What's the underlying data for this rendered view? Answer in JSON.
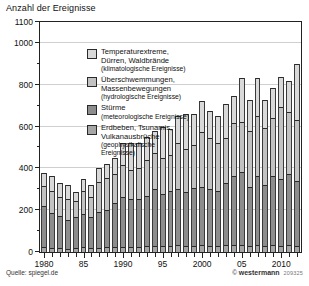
{
  "title": "Anzahl der Ereignisse",
  "source_label": "Quelle: spiegel.de",
  "credit": {
    "symbol": "©",
    "brand": "westermann",
    "code": "209325"
  },
  "colors": {
    "climatological": "#d9d9d9",
    "hydrological": "#c2c2c2",
    "meteorological": "#8d8d8d",
    "geophysical": "#a6a6a6",
    "grid": "#cfcfcf",
    "axis": "#222222",
    "background": "#ffffff"
  },
  "legend": {
    "position": "inside-top-left",
    "items": [
      {
        "key": "climatological",
        "main": "Temperaturextreme,",
        "main2": "Dürren, Waldbrände",
        "sub": "(klimatologische Ereignisse)",
        "color": "#d9d9d9"
      },
      {
        "key": "hydrological",
        "main": "Überschwemmungen,",
        "main2": "Massenbewegungen",
        "sub": "(hydrologische Ereignisse)",
        "color": "#c2c2c2"
      },
      {
        "key": "meteorological",
        "main": "Stürme",
        "main2": "",
        "sub": "(meteorologische Ereignisse)",
        "color": "#8d8d8d"
      },
      {
        "key": "geophysical",
        "main": "Erdbeben, Tsunamis,",
        "main2": "Vulkanausbrüche",
        "sub": "(geophysikalische",
        "sub2": "Ereignisse)",
        "color": "#a6a6a6"
      }
    ]
  },
  "chart_data": {
    "type": "bar",
    "stacked": true,
    "title": "Anzahl der Ereignisse",
    "xlabel": "",
    "ylabel": "Anzahl der Ereignisse",
    "ylim": [
      0,
      1100
    ],
    "ytick_step": 200,
    "yminor_step": 100,
    "ytick_labels": [
      "0",
      "200",
      "400",
      "600",
      "800",
      "1000",
      "1100"
    ],
    "ytick_values": [
      0,
      200,
      400,
      600,
      800,
      1000,
      1100
    ],
    "grid": true,
    "grid_axis": "y",
    "legend_position": "inside-top-left",
    "x": [
      1980,
      1981,
      1982,
      1983,
      1984,
      1985,
      1986,
      1987,
      1988,
      1989,
      1990,
      1991,
      1992,
      1993,
      1994,
      1995,
      1996,
      1997,
      1998,
      1999,
      2000,
      2001,
      2002,
      2003,
      2004,
      2005,
      2006,
      2007,
      2008,
      2009,
      2010,
      2011,
      2012
    ],
    "xtick_labels": [
      "1980",
      "85",
      "1990",
      "95",
      "2000",
      "05",
      "2010"
    ],
    "xtick_positions": [
      1980,
      1985,
      1990,
      1995,
      2000,
      2005,
      2010
    ],
    "categories": [
      1980,
      1981,
      1982,
      1983,
      1984,
      1985,
      1986,
      1987,
      1988,
      1989,
      1990,
      1991,
      1992,
      1993,
      1994,
      1995,
      1996,
      1997,
      1998,
      1999,
      2000,
      2001,
      2002,
      2003,
      2004,
      2005,
      2006,
      2007,
      2008,
      2009,
      2010,
      2011,
      2012
    ],
    "series": [
      {
        "name": "Erdbeben, Tsunamis, Vulkanausbrüche (geophysikalische Ereignisse)",
        "short": "geophysical",
        "color": "#a6a6a6",
        "values": [
          22,
          18,
          20,
          15,
          18,
          22,
          18,
          20,
          22,
          25,
          25,
          24,
          22,
          28,
          30,
          28,
          30,
          32,
          28,
          30,
          32,
          30,
          28,
          32,
          35,
          35,
          30,
          32,
          30,
          34,
          30,
          32,
          30
        ]
      },
      {
        "name": "Stürme (meteorologische Ereignisse)",
        "short": "meteorological",
        "color": "#8d8d8d",
        "values": [
          200,
          170,
          150,
          140,
          150,
          160,
          150,
          170,
          180,
          210,
          240,
          230,
          230,
          240,
          270,
          250,
          260,
          270,
          260,
          275,
          280,
          270,
          265,
          300,
          330,
          350,
          280,
          330,
          290,
          330,
          320,
          340,
          310
        ]
      },
      {
        "name": "Überschwemmungen, Massenbewegungen (hydrologische Ereignisse)",
        "short": "hydrological",
        "color": "#c2c2c2",
        "values": [
          95,
          105,
          95,
          100,
          75,
          110,
          95,
          145,
          150,
          140,
          150,
          140,
          150,
          170,
          175,
          170,
          175,
          220,
          205,
          205,
          260,
          245,
          230,
          215,
          250,
          235,
          270,
          290,
          275,
          275,
          345,
          300,
          290
        ]
      },
      {
        "name": "Temperaturextreme, Dürren, Waldbrände (klimatologische Ereignisse)",
        "short": "climatological",
        "color": "#d9d9d9",
        "values": [
          63,
          72,
          65,
          65,
          42,
          58,
          57,
          65,
          68,
          75,
          105,
          126,
          118,
          112,
          105,
          152,
          125,
          128,
          167,
          150,
          148,
          130,
          127,
          163,
          130,
          210,
          145,
          180,
          130,
          145,
          140,
          145,
          270
        ]
      }
    ],
    "totals": [
      380,
      365,
      330,
      320,
      285,
      350,
      320,
      400,
      420,
      450,
      520,
      520,
      520,
      550,
      580,
      600,
      590,
      650,
      660,
      660,
      720,
      675,
      650,
      710,
      745,
      830,
      725,
      832,
      725,
      784,
      835,
      817,
      900
    ]
  }
}
